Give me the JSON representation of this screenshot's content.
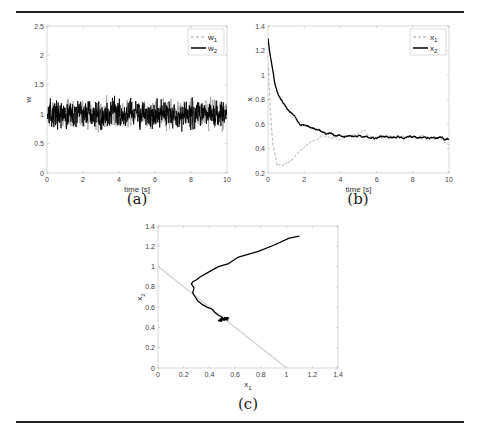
{
  "figure": {
    "captions": {
      "a": "(a)",
      "b": "(b)",
      "c": "(c)"
    }
  },
  "chart_data": [
    {
      "id": "a",
      "type": "line",
      "title": "",
      "xlabel": "time [s]",
      "ylabel": "w",
      "xlim": [
        0,
        10
      ],
      "ylim": [
        0,
        2.5
      ],
      "xticks": [
        0,
        2,
        4,
        6,
        8,
        10
      ],
      "yticks": [
        0,
        0.5,
        1,
        1.5,
        2,
        2.5
      ],
      "ytick_labels": [
        "0",
        "0.5",
        "1",
        "1.5",
        "2",
        "2.5"
      ],
      "legend": {
        "position": "top-right",
        "entries": [
          "w1",
          "w2"
        ]
      },
      "grid": false,
      "series": [
        {
          "name": "w1",
          "style": "dashed",
          "color": "#a8a8a8",
          "mean": 1.0,
          "noise_amplitude": 0.45,
          "min": 0.1,
          "max": 2.05,
          "samples": 1000,
          "seed": 7
        },
        {
          "name": "w2",
          "style": "solid",
          "color": "#000000",
          "mean": 1.0,
          "noise_amplitude": 0.45,
          "min": 0.03,
          "max": 2.03,
          "samples": 1000,
          "seed": 13
        }
      ]
    },
    {
      "id": "b",
      "type": "line",
      "title": "",
      "xlabel": "time [s]",
      "ylabel": "x",
      "xlim": [
        0,
        10
      ],
      "ylim": [
        0.2,
        1.4
      ],
      "xticks": [
        0,
        2,
        4,
        6,
        8,
        10
      ],
      "yticks": [
        0.2,
        0.4,
        0.6,
        0.8,
        1,
        1.2,
        1.4
      ],
      "ytick_labels": [
        "0.2",
        "0.4",
        "0.6",
        "0.8",
        "1",
        "1.2",
        "1.4"
      ],
      "legend": {
        "position": "top-right",
        "entries": [
          "x1",
          "x2"
        ]
      },
      "grid": false,
      "series": [
        {
          "name": "x1",
          "style": "dashed",
          "color": "#a8a8a8",
          "points": [
            [
              0,
              1.1
            ],
            [
              0.1,
              0.8
            ],
            [
              0.25,
              0.45
            ],
            [
              0.5,
              0.27
            ],
            [
              0.8,
              0.27
            ],
            [
              1.2,
              0.3
            ],
            [
              1.6,
              0.35
            ],
            [
              2.0,
              0.41
            ],
            [
              2.4,
              0.45
            ],
            [
              2.8,
              0.49
            ],
            [
              3.2,
              0.5
            ],
            [
              3.6,
              0.49
            ],
            [
              4.0,
              0.47
            ],
            [
              4.5,
              0.5
            ],
            [
              5.0,
              0.52
            ],
            [
              5.3,
              0.55
            ],
            [
              5.6,
              0.5
            ],
            [
              6.0,
              0.49
            ],
            [
              6.5,
              0.5
            ],
            [
              7.0,
              0.49
            ],
            [
              7.5,
              0.5
            ],
            [
              8.0,
              0.49
            ],
            [
              8.5,
              0.5
            ],
            [
              9.0,
              0.48
            ],
            [
              9.5,
              0.48
            ],
            [
              10.0,
              0.43
            ]
          ],
          "noise_amplitude": 0.012,
          "seed": 21
        },
        {
          "name": "x2",
          "style": "solid",
          "color": "#000000",
          "points": [
            [
              0,
              1.3
            ],
            [
              0.1,
              1.18
            ],
            [
              0.25,
              1.05
            ],
            [
              0.4,
              0.93
            ],
            [
              0.6,
              0.83
            ],
            [
              0.9,
              0.76
            ],
            [
              1.2,
              0.7
            ],
            [
              1.5,
              0.66
            ],
            [
              1.8,
              0.6
            ],
            [
              2.2,
              0.58
            ],
            [
              2.6,
              0.55
            ],
            [
              3.0,
              0.53
            ],
            [
              3.5,
              0.52
            ],
            [
              4.0,
              0.5
            ],
            [
              4.5,
              0.5
            ],
            [
              5.0,
              0.5
            ],
            [
              5.5,
              0.49
            ],
            [
              6.0,
              0.48
            ],
            [
              6.5,
              0.5
            ],
            [
              7.0,
              0.5
            ],
            [
              7.5,
              0.49
            ],
            [
              8.0,
              0.5
            ],
            [
              8.5,
              0.49
            ],
            [
              9.0,
              0.48
            ],
            [
              9.5,
              0.49
            ],
            [
              10.0,
              0.47
            ]
          ],
          "noise_amplitude": 0.012,
          "seed": 33
        }
      ]
    },
    {
      "id": "c",
      "type": "line",
      "title": "",
      "xlabel": "x1",
      "ylabel": "x2",
      "xlim": [
        0,
        1.4
      ],
      "ylim": [
        0,
        1.4
      ],
      "xticks": [
        0,
        0.2,
        0.4,
        0.6,
        0.8,
        1,
        1.2,
        1.4
      ],
      "xtick_labels": [
        "0",
        "0.2",
        "0.4",
        "0.6",
        "0.8",
        "1",
        "1.2",
        "1.4"
      ],
      "yticks": [
        0,
        0.2,
        0.4,
        0.6,
        0.8,
        1,
        1.2,
        1.4
      ],
      "ytick_labels": [
        "0",
        "0.2",
        "0.4",
        "0.6",
        "0.8",
        "1",
        "1.2",
        "1.4"
      ],
      "legend": null,
      "grid": false,
      "series": [
        {
          "name": "constraint x1+x2=1",
          "style": "solid",
          "color": "#d0d0d0",
          "points": [
            [
              0,
              1
            ],
            [
              1,
              0
            ]
          ]
        },
        {
          "name": "trajectory",
          "style": "solid",
          "color": "#000000",
          "points": [
            [
              1.1,
              1.3
            ],
            [
              1.02,
              1.28
            ],
            [
              0.9,
              1.21
            ],
            [
              0.78,
              1.15
            ],
            [
              0.62,
              1.09
            ],
            [
              0.55,
              1.03
            ],
            [
              0.47,
              1.0
            ],
            [
              0.4,
              0.95
            ],
            [
              0.33,
              0.9
            ],
            [
              0.3,
              0.87
            ],
            [
              0.27,
              0.85
            ],
            [
              0.26,
              0.83
            ],
            [
              0.28,
              0.79
            ],
            [
              0.27,
              0.74
            ],
            [
              0.29,
              0.7
            ],
            [
              0.31,
              0.66
            ],
            [
              0.34,
              0.63
            ],
            [
              0.38,
              0.6
            ],
            [
              0.42,
              0.58
            ],
            [
              0.44,
              0.55
            ],
            [
              0.47,
              0.52
            ],
            [
              0.5,
              0.5
            ]
          ],
          "cluster": {
            "center": [
              0.5,
              0.5
            ],
            "radius": [
              0.05,
              0.04
            ],
            "count": 260,
            "seed": 5
          }
        }
      ]
    }
  ]
}
